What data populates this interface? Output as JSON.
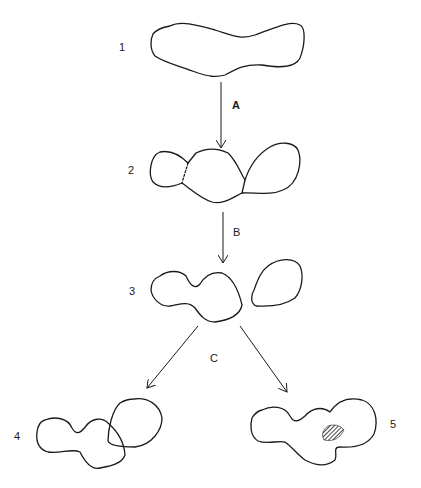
{
  "diagram": {
    "stages": [
      {
        "id": "1",
        "label": "1",
        "description": "single elongated blob"
      },
      {
        "id": "2",
        "label": "2",
        "description": "blob constricting into three lobes"
      },
      {
        "id": "3",
        "label": "3",
        "description": "two separated blobs"
      },
      {
        "id": "4",
        "label": "4",
        "description": "two blobs overlapping (outlines crossing)"
      },
      {
        "id": "5",
        "label": "5",
        "description": "two blobs fused with hatched contact region"
      }
    ],
    "transitions": [
      {
        "label": "A",
        "from": "1",
        "to": "2"
      },
      {
        "label": "B",
        "from": "2",
        "to": "3"
      },
      {
        "label": "C",
        "from": "3",
        "to": [
          "4",
          "5"
        ]
      }
    ],
    "colors": {
      "ink": "#1a1a1a",
      "background": "#ffffff"
    }
  }
}
